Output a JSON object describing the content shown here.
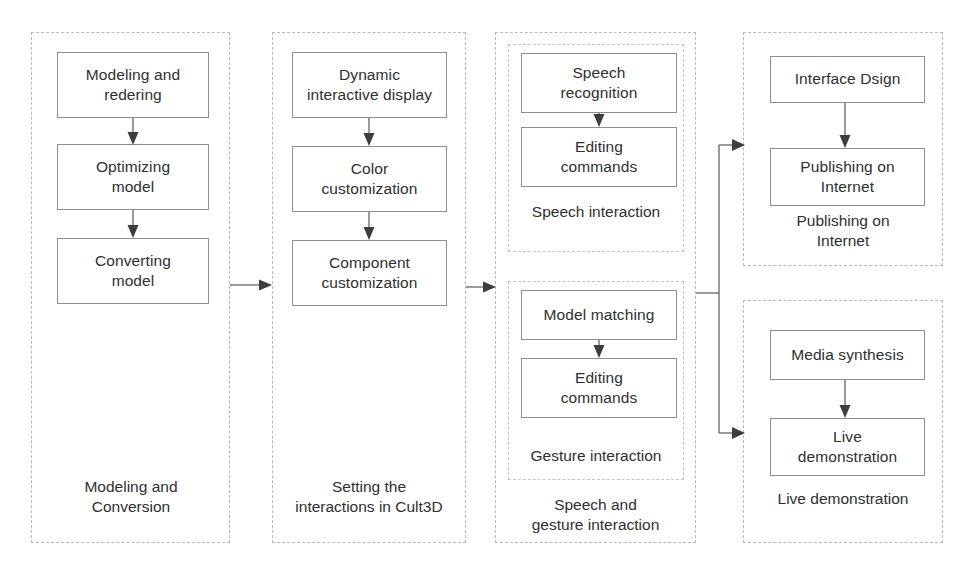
{
  "diagram": {
    "background_color": "#ffffff",
    "box_border_color": "#8e8e8e",
    "group_border_color": "#b9b9b9",
    "connector_color": "#6f6f6f"
  },
  "columns": [
    {
      "id": "modeling-and-conversion",
      "caption": "Modeling and\nConversion",
      "caption_line1": "Modeling and",
      "caption_line2": "Conversion",
      "nodes": [
        {
          "id": "modeling-and-redering",
          "line1": "Modeling and",
          "line2": "redering"
        },
        {
          "id": "optimizing-model",
          "line1": "Optimizing",
          "line2": "model"
        },
        {
          "id": "converting-model",
          "line1": "Converting",
          "line2": "model"
        }
      ]
    },
    {
      "id": "setting-the-interactions-in-cult3d",
      "caption": "Setting the\ninteractions in Cult3D",
      "caption_line1": "Setting the",
      "caption_line2": "interactions in Cult3D",
      "nodes": [
        {
          "id": "dynamic-interactive-display",
          "line1": "Dynamic",
          "line2": "interactive display"
        },
        {
          "id": "color-customization",
          "line1": "Color",
          "line2": "customization"
        },
        {
          "id": "component-customization",
          "line1": "Component",
          "line2": "customization"
        }
      ]
    },
    {
      "id": "speech-and-gesture-interaction",
      "caption": "Speech and\ngesture interaction",
      "caption_line1": "Speech and",
      "caption_line2": "gesture interaction",
      "subgroups": [
        {
          "id": "speech-interaction",
          "caption": "Speech interaction",
          "nodes": [
            {
              "id": "speech-recognition",
              "line1": "Speech",
              "line2": "recognition"
            },
            {
              "id": "editing-commands-speech",
              "line1": "Editing",
              "line2": "commands"
            }
          ]
        },
        {
          "id": "gesture-interaction",
          "caption": "Gesture interaction",
          "nodes": [
            {
              "id": "model-matching",
              "line1": "Model matching",
              "line2": ""
            },
            {
              "id": "editing-commands-gesture",
              "line1": "Editing",
              "line2": "commands"
            }
          ]
        }
      ]
    },
    {
      "id": "publishing-on-internet",
      "caption": "Publishing on\nInternet",
      "caption_line1": "Publishing on",
      "caption_line2": "Internet",
      "nodes": [
        {
          "id": "interface-dsign",
          "line1": "Interface Dsign",
          "line2": ""
        },
        {
          "id": "publishing-on-internet-node",
          "line1": "Publishing on",
          "line2": "Internet"
        }
      ]
    },
    {
      "id": "live-demonstration",
      "caption": "Live demonstration",
      "caption_line1": "Live demonstration",
      "caption_line2": "",
      "nodes": [
        {
          "id": "media-synthesis",
          "line1": "Media synthesis",
          "line2": ""
        },
        {
          "id": "live-demonstration-node",
          "line1": "Live",
          "line2": "demonstration"
        }
      ]
    }
  ],
  "connectors": [
    {
      "id": "modeling-to-optimizing",
      "from": "modeling-and-redering",
      "to": "optimizing-model",
      "direction": "down"
    },
    {
      "id": "optimizing-to-converting",
      "from": "optimizing-model",
      "to": "converting-model",
      "direction": "down"
    },
    {
      "id": "col1-to-col2",
      "from": "modeling-and-conversion",
      "to": "setting-the-interactions-in-cult3d",
      "direction": "right"
    },
    {
      "id": "dynamic-to-color",
      "from": "dynamic-interactive-display",
      "to": "color-customization",
      "direction": "down"
    },
    {
      "id": "color-to-component",
      "from": "color-customization",
      "to": "component-customization",
      "direction": "down"
    },
    {
      "id": "col2-to-col3",
      "from": "setting-the-interactions-in-cult3d",
      "to": "speech-and-gesture-interaction",
      "direction": "right"
    },
    {
      "id": "speech-recognition-to-editing",
      "from": "speech-recognition",
      "to": "editing-commands-speech",
      "direction": "down"
    },
    {
      "id": "model-matching-to-editing",
      "from": "model-matching",
      "to": "editing-commands-gesture",
      "direction": "down"
    },
    {
      "id": "col3-to-publishing",
      "from": "speech-and-gesture-interaction",
      "to": "publishing-on-internet",
      "direction": "branch-up-right"
    },
    {
      "id": "col3-to-live-demo",
      "from": "speech-and-gesture-interaction",
      "to": "live-demonstration",
      "direction": "branch-down-right"
    },
    {
      "id": "interface-to-publishing",
      "from": "interface-dsign",
      "to": "publishing-on-internet-node",
      "direction": "down"
    },
    {
      "id": "media-to-live",
      "from": "media-synthesis",
      "to": "live-demonstration-node",
      "direction": "down"
    }
  ]
}
